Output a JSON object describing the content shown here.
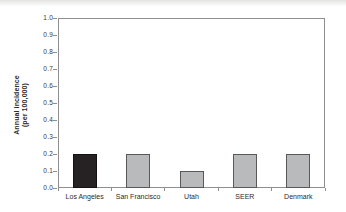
{
  "figure": {
    "background": "#ffffff",
    "axis_color": "#8f8f8f",
    "text_color": "#2e2a2b"
  },
  "chart_data": {
    "type": "bar",
    "title": "",
    "xlabel": "",
    "ylabel_lines": [
      "Annual incidence",
      "(per 100,000)"
    ],
    "categories": [
      "Los Angeles",
      "San Francisco",
      "Utah",
      "SEER",
      "Denmark"
    ],
    "values": [
      0.2,
      0.2,
      0.1,
      0.2,
      0.2
    ],
    "bar_fill_colors": [
      "#262223",
      "#b9babb",
      "#b9babb",
      "#b9babb",
      "#b9babb"
    ],
    "bar_border_colors": [
      "#151112",
      "#58595b",
      "#58595b",
      "#58595b",
      "#58595b"
    ],
    "ylim": [
      0.0,
      1.0
    ],
    "ytick_labels": [
      "0.0",
      "0.1",
      "0.2",
      "0.3",
      "0.4",
      "0.5",
      "0.6",
      "0.7",
      "0.8",
      "0.9",
      "1.0"
    ],
    "grid": false,
    "legend": null,
    "plot_box": true
  }
}
